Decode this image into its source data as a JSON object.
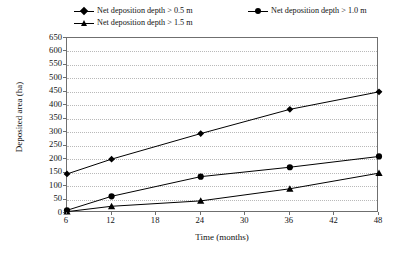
{
  "chart_data": {
    "type": "line",
    "title": "",
    "xlabel": "Time (months)",
    "ylabel": "Deposited area (ha)",
    "x": [
      6,
      12,
      24,
      36,
      48
    ],
    "xlim": [
      6,
      48
    ],
    "ylim": [
      0,
      650
    ],
    "x_ticks": [
      "6",
      "12",
      "18",
      "24",
      "30",
      "36",
      "42",
      "48"
    ],
    "x_tick_values": [
      6,
      12,
      18,
      24,
      30,
      36,
      42,
      48
    ],
    "y_ticks": [
      "0",
      "50",
      "100",
      "150",
      "200",
      "250",
      "300",
      "350",
      "400",
      "450",
      "500",
      "550",
      "600",
      "650"
    ],
    "y_tick_values": [
      0,
      50,
      100,
      150,
      200,
      250,
      300,
      350,
      400,
      450,
      500,
      550,
      600,
      650
    ],
    "grid": true,
    "legend_position": "top",
    "series": [
      {
        "name": "Net deposition depth > 0.5 m",
        "marker": "diamond",
        "color": "#000000",
        "values": [
          145,
          200,
          295,
          385,
          450
        ]
      },
      {
        "name": "Net deposition depth > 1.0 m",
        "marker": "circle",
        "color": "#000000",
        "values": [
          10,
          62,
          135,
          170,
          210
        ]
      },
      {
        "name": "Net deposition depth > 1.5 m",
        "marker": "triangle",
        "color": "#000000",
        "values": [
          5,
          25,
          45,
          90,
          148
        ]
      }
    ]
  },
  "legend": {
    "entries": [
      {
        "label": "Net deposition depth > 0.5 m",
        "marker": "diamond"
      },
      {
        "label": "Net deposition depth > 1.0 m",
        "marker": "circle"
      },
      {
        "label": "Net deposition depth > 1.5 m",
        "marker": "triangle"
      }
    ]
  },
  "axes": {
    "x_title": "Time (months)",
    "y_title": "Deposited area (ha)"
  }
}
